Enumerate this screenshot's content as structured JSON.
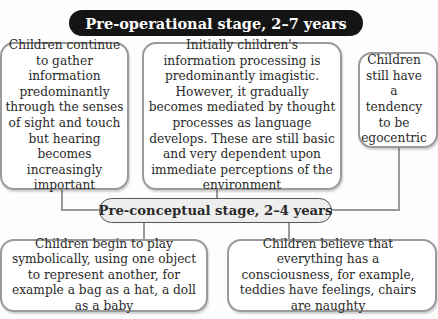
{
  "diagram": {
    "title": "Pre-operational stage, 2–7 years",
    "top_boxes": [
      {
        "text": "Children continue to gather information predominantly through the senses of sight and touch but hearing becomes increasingly important"
      },
      {
        "text": "Initially children's information processing is predominantly imagistic. However, it gradually becomes mediated by thought processes as language develops. These are still basic and very dependent upon immediate perceptions of the environment"
      },
      {
        "text": "Children still have a tendency to be egocentric"
      }
    ],
    "sub_stage": "Pre-conceptual stage, 2–4 years",
    "bottom_boxes": [
      {
        "text": "Children begin to play symbolically, using one object to represent another, for example a bag as a hat, a doll as a baby"
      },
      {
        "text": "Children believe that everything has a consciousness, for example, teddies have feelings, chairs are naughty"
      }
    ],
    "colors": {
      "title_bg": "#141414",
      "title_text": "#ffffff",
      "box_border": "#9a9a9a",
      "sub_stage_bg": "#eeeeee"
    }
  }
}
